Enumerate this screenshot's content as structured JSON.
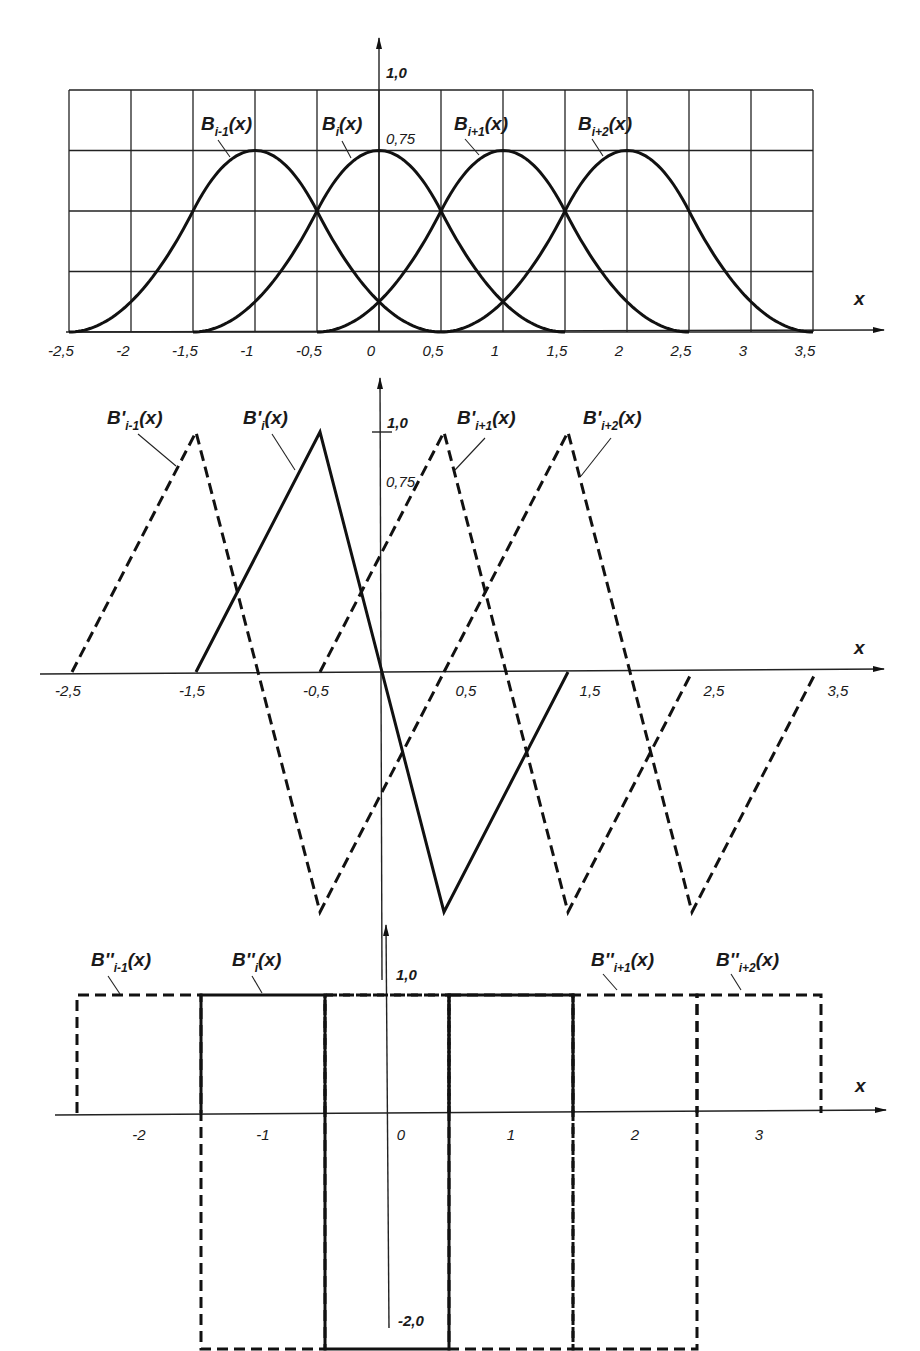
{
  "chart_data": [
    {
      "type": "line",
      "title": "Cubic B-spline basis functions",
      "xlabel": "x",
      "ylabel": "",
      "xlim": [
        -2.5,
        3.5
      ],
      "ylim": [
        0,
        1.0
      ],
      "grid": true,
      "x_ticks": [
        "-2,5",
        "-2",
        "-1,5",
        "-1",
        "-0,5",
        "0",
        "0,5",
        "1",
        "1,5",
        "2",
        "2,5",
        "3",
        "3,5"
      ],
      "y_ticks": [
        "1,0",
        "0,75"
      ],
      "series": [
        {
          "name": "B_{i-1}(x)",
          "style": "solid",
          "support": [
            -2.5,
            0.5
          ],
          "peak_x": -1,
          "peak_y": 0.75,
          "x": [
            -2.5,
            -2,
            -1.5,
            -1,
            -0.5,
            0,
            0.5
          ],
          "y": [
            0,
            0.1875,
            0.5625,
            0.75,
            0.5625,
            0.1875,
            0
          ]
        },
        {
          "name": "B_i(x)",
          "style": "solid",
          "support": [
            -1.5,
            1.5
          ],
          "peak_x": 0,
          "peak_y": 0.75,
          "x": [
            -1.5,
            -1,
            -0.5,
            0,
            0.5,
            1,
            1.5
          ],
          "y": [
            0,
            0.1875,
            0.5625,
            0.75,
            0.5625,
            0.1875,
            0
          ]
        },
        {
          "name": "B_{i+1}(x)",
          "style": "solid",
          "support": [
            -0.5,
            2.5
          ],
          "peak_x": 1,
          "peak_y": 0.75,
          "x": [
            -0.5,
            0,
            0.5,
            1,
            1.5,
            2,
            2.5
          ],
          "y": [
            0,
            0.1875,
            0.5625,
            0.75,
            0.5625,
            0.1875,
            0
          ]
        },
        {
          "name": "B_{i+2}(x)",
          "style": "solid",
          "support": [
            0.5,
            3.5
          ],
          "peak_x": 2,
          "peak_y": 0.75,
          "x": [
            0.5,
            1,
            1.5,
            2,
            2.5,
            3,
            3.5
          ],
          "y": [
            0,
            0.1875,
            0.5625,
            0.75,
            0.5625,
            0.1875,
            0
          ]
        }
      ]
    },
    {
      "type": "line",
      "title": "First derivatives B'(x)",
      "xlabel": "x",
      "xlim": [
        -2.5,
        3.5
      ],
      "ylim": [
        -1.0,
        1.0
      ],
      "grid": false,
      "x_ticks": [
        "-2,5",
        "-1,5",
        "-0,5",
        "0,5",
        "1,5",
        "2,5",
        "3,5"
      ],
      "y_ticks": [
        "1,0",
        "0,75"
      ],
      "series": [
        {
          "name": "B'_{i-1}(x)",
          "style": "dashed",
          "x": [
            -2.5,
            -1.5,
            -0.5,
            0.5
          ],
          "y": [
            0,
            1,
            -1,
            0
          ]
        },
        {
          "name": "B'_i(x)",
          "style": "solid",
          "x": [
            -1.5,
            -0.5,
            0.5,
            1.5
          ],
          "y": [
            0,
            1,
            -1,
            0
          ]
        },
        {
          "name": "B'_{i+1}(x)",
          "style": "dashed",
          "x": [
            -0.5,
            0.5,
            1.5,
            2.5
          ],
          "y": [
            0,
            1,
            -1,
            0
          ]
        },
        {
          "name": "B'_{i+2}(x)",
          "style": "dashed",
          "x": [
            0.5,
            1.5,
            2.5,
            3.5
          ],
          "y": [
            0,
            1,
            -1,
            0
          ]
        }
      ]
    },
    {
      "type": "line",
      "title": "Second derivatives B''(x)",
      "xlabel": "x",
      "xlim": [
        -2.5,
        3.5
      ],
      "ylim": [
        -2.0,
        1.0
      ],
      "grid": false,
      "x_ticks": [
        "-2",
        "-1",
        "0",
        "1",
        "2",
        "3"
      ],
      "y_ticks": [
        "1,0",
        "-2,0"
      ],
      "series": [
        {
          "name": "B''_{i-1}(x)",
          "style": "dashed",
          "steps": [
            [
              -2.5,
              -1.5,
              1
            ],
            [
              -1.5,
              -0.5,
              -2
            ],
            [
              -0.5,
              0.5,
              1
            ]
          ]
        },
        {
          "name": "B''_i(x)",
          "style": "solid",
          "steps": [
            [
              -1.5,
              -0.5,
              1
            ],
            [
              -0.5,
              0.5,
              -2
            ],
            [
              0.5,
              1.5,
              1
            ]
          ]
        },
        {
          "name": "B''_{i+1}(x)",
          "style": "dashed",
          "steps": [
            [
              -0.5,
              0.5,
              1
            ],
            [
              0.5,
              1.5,
              -2
            ],
            [
              1.5,
              2.5,
              1
            ]
          ]
        },
        {
          "name": "B''_{i+2}(x)",
          "style": "dashed",
          "steps": [
            [
              0.5,
              1.5,
              1
            ],
            [
              1.5,
              2.5,
              -2
            ],
            [
              2.5,
              3.5,
              1
            ]
          ]
        }
      ]
    }
  ],
  "labels": {
    "axis_x": "x",
    "top": {
      "y_max": "1,0",
      "y_peak": "0,75",
      "ticks": [
        "-2,5",
        "-2",
        "-1,5",
        "-1",
        "-0,5",
        "0",
        "0,5",
        "1",
        "1,5",
        "2",
        "2,5",
        "3",
        "3,5"
      ],
      "curves": [
        {
          "base": "B",
          "sub": "i-1",
          "tail": "(x)"
        },
        {
          "base": "B",
          "sub": "i",
          "tail": "(x)"
        },
        {
          "base": "B",
          "sub": "i+1",
          "tail": "(x)"
        },
        {
          "base": "B",
          "sub": "i+2",
          "tail": "(x)"
        }
      ]
    },
    "middle": {
      "y_max": "1,0",
      "y_peak": "0,75",
      "ticks": [
        "-2,5",
        "-1,5",
        "-0,5",
        "0,5",
        "1,5",
        "2,5",
        "3,5"
      ],
      "curves": [
        {
          "base": "B'",
          "sub": "i-1",
          "tail": "(x)"
        },
        {
          "base": "B'",
          "sub": "i",
          "tail": "(x)"
        },
        {
          "base": "B'",
          "sub": "i+1",
          "tail": "(x)"
        },
        {
          "base": "B'",
          "sub": "i+2",
          "tail": "(x)"
        }
      ]
    },
    "bottom": {
      "y_max": "1,0",
      "y_min": "-2,0",
      "ticks": [
        "-2",
        "-1",
        "0",
        "1",
        "2",
        "3"
      ],
      "curves": [
        {
          "base": "B''",
          "sub": "i-1",
          "tail": "(x)"
        },
        {
          "base": "B''",
          "sub": "i",
          "tail": "(x)"
        },
        {
          "base": "B''",
          "sub": "i+1",
          "tail": "(x)"
        },
        {
          "base": "B''",
          "sub": "i+2",
          "tail": "(x)"
        }
      ]
    }
  }
}
